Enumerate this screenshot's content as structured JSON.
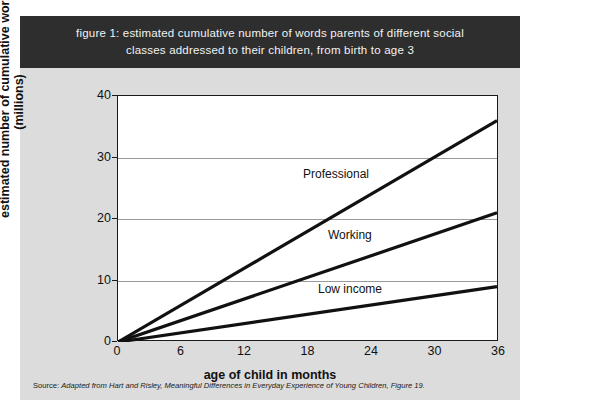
{
  "figure": {
    "title": "figure 1: estimated cumulative number of words parents of different social classes addressed to their children, from birth to age 3",
    "title_line1": "figure 1: estimated cumulative number of words parents of different social",
    "title_line2": "classes addressed to their children, from birth to age 3",
    "source_prefix": "Source: ",
    "source_italic": "Adapted from Hart and Risley, Meaningful Differences in Everyday Experience of Young Children, Figure 19.",
    "source_full": "Source: Adapted from Hart and Risley, Meaningful Differences in Everyday Experience of Young Children, Figure 19."
  },
  "colors": {
    "title_band": "#2e2e2e",
    "title_text": "#f2f2f2",
    "panel_background": "#dcdcdc",
    "plot_background": "#ffffff",
    "axis": "#1a1a1a",
    "gridline": "#9a9a9a",
    "line": "#111111"
  },
  "chart_data": {
    "type": "line",
    "title": "figure 1: estimated cumulative number of words parents of different social classes addressed to their children, from birth to age 3",
    "xlabel": "age of child in months",
    "ylabel": "estimated number of cumulative words (millions)",
    "ylabel_line1": "estimated number of cumulative words",
    "ylabel_line2": "(millions)",
    "x": [
      0,
      36
    ],
    "xlim": [
      0,
      36
    ],
    "ylim": [
      0,
      40
    ],
    "xticks": [
      0,
      6,
      12,
      18,
      24,
      30,
      36
    ],
    "yticks": [
      0,
      10,
      20,
      30,
      40
    ],
    "grid": "horizontal",
    "legend": "inline-labels",
    "series": [
      {
        "name": "Professional",
        "values": [
          0,
          36
        ],
        "label": "Professional"
      },
      {
        "name": "Working",
        "values": [
          0,
          21
        ],
        "label": "Working"
      },
      {
        "name": "Low income",
        "values": [
          0,
          9
        ],
        "label": "Low income"
      }
    ]
  }
}
